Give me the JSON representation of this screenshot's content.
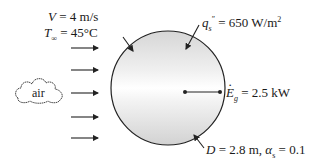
{
  "inflow": {
    "velocity_symbol": "V",
    "velocity_value": " = 4 m/s",
    "temperature_symbol": "T",
    "temperature_subscript": "∞",
    "temperature_value": " = 45°C",
    "fluid_label": "air"
  },
  "heat_flux": {
    "symbol": "q",
    "subscript": "s",
    "superscript": "″",
    "value": " = 650 W/m",
    "unit_exp": "2"
  },
  "generation": {
    "symbol": "E",
    "subscript": "g",
    "value": " = 2.5 kW"
  },
  "sphere": {
    "diameter_symbol": "D",
    "diameter_value": " = 2.8 m, ",
    "absorptivity_symbol": "α",
    "absorptivity_subscript": "s",
    "absorptivity_value": " = 0.1"
  },
  "colors": {
    "line": "#222222",
    "sphere_fill_light": "#ffffff",
    "sphere_fill_dark": "#d9d9d9"
  }
}
